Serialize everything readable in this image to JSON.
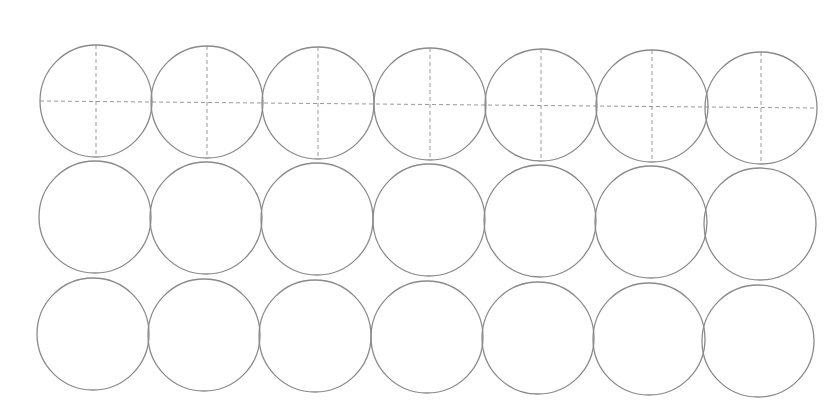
{
  "worksheet": {
    "rows": 3,
    "columns": 7,
    "stroke_color": "#8a8a8a",
    "guide_color": "#9a9a9a",
    "radius": 56,
    "grid": [
      {
        "row": 1,
        "has_guides": true,
        "centers": [
          [
            96,
            101
          ],
          [
            207,
            102
          ],
          [
            318,
            103
          ],
          [
            430,
            104
          ],
          [
            541,
            105
          ],
          [
            652,
            106
          ],
          [
            761,
            108
          ]
        ]
      },
      {
        "row": 2,
        "has_guides": false,
        "centers": [
          [
            95,
            217
          ],
          [
            206,
            218
          ],
          [
            317,
            219
          ],
          [
            429,
            220
          ],
          [
            540,
            221
          ],
          [
            651,
            222
          ],
          [
            760,
            224
          ]
        ]
      },
      {
        "row": 3,
        "has_guides": false,
        "centers": [
          [
            93,
            334
          ],
          [
            204,
            335
          ],
          [
            315,
            336
          ],
          [
            427,
            337
          ],
          [
            538,
            338
          ],
          [
            649,
            339
          ],
          [
            758,
            341
          ]
        ]
      }
    ]
  }
}
